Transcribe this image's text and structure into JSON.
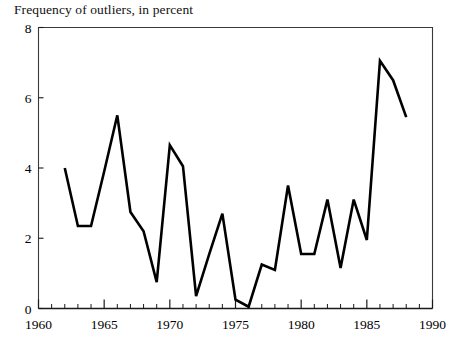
{
  "chart_data": {
    "type": "line",
    "title": "Frequency of outliers, in percent",
    "xlabel": "",
    "ylabel": "",
    "xlim": [
      1960,
      1990
    ],
    "ylim": [
      0,
      8
    ],
    "ytick_labels": [
      "0",
      "2",
      "4",
      "6",
      "8"
    ],
    "yticks": [
      0,
      2,
      4,
      6,
      8
    ],
    "xtick_labels": [
      "1960",
      "1965",
      "1970",
      "1975",
      "1980",
      "1985",
      "1990"
    ],
    "xticks": [
      1960,
      1965,
      1970,
      1975,
      1980,
      1985,
      1990
    ],
    "minor_xtick_interval": 1,
    "grid": false,
    "legend": false,
    "line_color": "#000000",
    "line_width": 2.6,
    "frame": true,
    "x": [
      1962,
      1963,
      1964,
      1965,
      1966,
      1967,
      1968,
      1969,
      1970,
      1971,
      1972,
      1973,
      1974,
      1975,
      1976,
      1977,
      1978,
      1979,
      1980,
      1981,
      1982,
      1983,
      1984,
      1985,
      1986,
      1987,
      1988
    ],
    "values": [
      4.0,
      2.35,
      2.35,
      3.9,
      5.5,
      2.75,
      2.2,
      0.75,
      4.65,
      4.05,
      0.35,
      1.55,
      2.7,
      0.25,
      0.05,
      1.25,
      1.1,
      3.5,
      1.55,
      1.55,
      3.1,
      1.15,
      3.1,
      1.95,
      7.05,
      6.5,
      5.45
    ]
  }
}
